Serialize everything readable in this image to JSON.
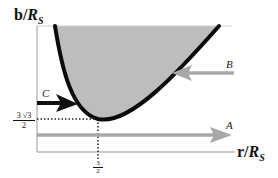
{
  "diagram": {
    "y_axis_label": {
      "main": "b/",
      "var": "R",
      "sub": "S"
    },
    "x_axis_label": {
      "main": "r/",
      "var": "R",
      "sub": "S"
    },
    "y_tick": {
      "numerator": "3 √3",
      "denominator": "2",
      "value": "3√3/2"
    },
    "x_tick": {
      "numerator": "3",
      "denominator": "2",
      "value": "3/2"
    },
    "arrows": [
      {
        "label": "A",
        "color": "#a8a8a8",
        "direction": "right"
      },
      {
        "label": "B",
        "color": "#a8a8a8",
        "direction": "left"
      },
      {
        "label": "C",
        "color": "#111111",
        "direction": "right"
      }
    ],
    "colors": {
      "shaded_region": "#bdbdbd",
      "curve": "#0a0a0a",
      "axis": "#999999",
      "dotted": "#222222"
    }
  }
}
